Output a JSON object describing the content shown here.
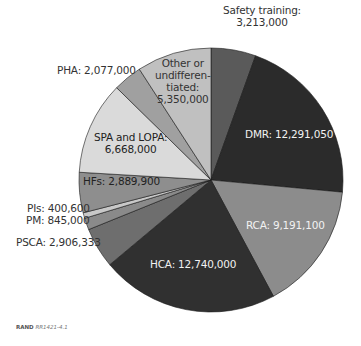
{
  "chart_data": {
    "type": "pie",
    "title": "",
    "start_angle_deg": 0,
    "direction": "clockwise",
    "slices": [
      {
        "name": "Safety training",
        "value": 3213000,
        "label": "Safety training:",
        "value_label": "3,213,000",
        "color": "#5a5a5a"
      },
      {
        "name": "DMR",
        "value": 12291050,
        "label": "DMR: 12,291,050",
        "color": "#2b2b2b"
      },
      {
        "name": "RCA",
        "value": 9191100,
        "label": "RCA: 9,191,100",
        "color": "#8c8c8c"
      },
      {
        "name": "HCA",
        "value": 12740000,
        "label": "HCA: 12,740,000",
        "color": "#303030"
      },
      {
        "name": "PSCA",
        "value": 2906333,
        "label": "PSCA: 2,906,333",
        "color": "#6e6e6e"
      },
      {
        "name": "PM",
        "value": 845000,
        "label": "PM: 845,000",
        "color": "#8a8a8a"
      },
      {
        "name": "PIs",
        "value": 400600,
        "label": "PIs: 400,600",
        "color": "#c8c8c8"
      },
      {
        "name": "HFs",
        "value": 2889900,
        "label": "HFs: 2,889,900",
        "color": "#8e8e8e"
      },
      {
        "name": "SPA and LOPA",
        "value": 6668000,
        "label": "SPA and LOPA:",
        "value_label": "6,668,000",
        "color": "#dadada"
      },
      {
        "name": "PHA",
        "value": 2077000,
        "label": "PHA: 2,077,000",
        "color": "#a0a0a0"
      },
      {
        "name": "Other or undifferentiated",
        "value": 5350000,
        "label_lines": [
          "Other or",
          "undifferen-",
          "tiated:",
          "5,350,000"
        ],
        "color": "#c0c0c0"
      }
    ],
    "legend": "none (labels on/near slices)"
  },
  "labels": {
    "safety_line1": "Safety training:",
    "safety_line2": "3,213,000",
    "dmr": "DMR: 12,291,050",
    "rca": "RCA: 9,191,100",
    "hca": "HCA: 12,740,000",
    "psca": "PSCA: 2,906,333",
    "pm": "PM: 845,000",
    "pis": "PIs: 400,600",
    "hfs": "HFs: 2,889,900",
    "spa_line1": "SPA and LOPA:",
    "spa_line2": "6,668,000",
    "pha": "PHA: 2,077,000",
    "other_line1": "Other or",
    "other_line2": "undifferen-",
    "other_line3": "tiated:",
    "other_line4": "5,350,000"
  },
  "source": {
    "org": "RAND",
    "id": "RR1421-4.1"
  }
}
